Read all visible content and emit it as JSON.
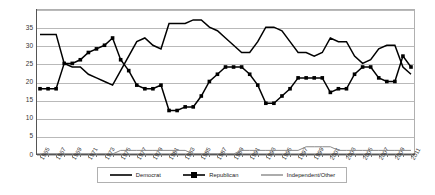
{
  "chart_data": {
    "type": "line",
    "title": "",
    "xlabel": "",
    "ylabel": "",
    "ylim": [
      0,
      40
    ],
    "ytick_values": [
      0,
      5,
      10,
      15,
      20,
      25,
      30,
      35
    ],
    "grid": true,
    "legend_position": "bottom",
    "x": [
      1965,
      1966,
      1967,
      1968,
      1969,
      1970,
      1971,
      1972,
      1973,
      1974,
      1975,
      1976,
      1977,
      1978,
      1979,
      1980,
      1981,
      1982,
      1983,
      1984,
      1985,
      1986,
      1987,
      1988,
      1989,
      1990,
      1991,
      1992,
      1993,
      1994,
      1995,
      1996,
      1997,
      1998,
      1999,
      2000,
      2001,
      2002,
      2003,
      2004,
      2005,
      2006,
      2007,
      2008,
      2009,
      2010,
      2011
    ],
    "xtick_labels": [
      "1965",
      "1967",
      "1969",
      "1971",
      "1973",
      "1975",
      "1977",
      "1979",
      "1981",
      "1983",
      "1985",
      "1987",
      "1989",
      "1991",
      "1993",
      "1995",
      "1997",
      "1999",
      "2001",
      "2003",
      "2005",
      "2007",
      "2009",
      "2011"
    ],
    "series": [
      {
        "name": "Democrat",
        "marker": "none",
        "color": "#000000",
        "values": [
          33,
          33,
          33,
          25,
          24,
          24,
          22,
          21,
          20,
          19,
          23,
          27,
          31,
          32,
          30,
          29,
          36,
          36,
          36,
          37,
          37,
          35,
          34,
          32,
          30,
          28,
          28,
          31,
          35,
          35,
          34,
          31,
          28,
          28,
          27,
          28,
          32,
          31,
          31,
          27,
          25,
          26,
          29,
          30,
          30,
          24,
          22
        ]
      },
      {
        "name": "Republican",
        "marker": "square",
        "color": "#000000",
        "values": [
          18,
          18,
          18,
          25,
          25,
          26,
          28,
          29,
          30,
          32,
          26,
          23,
          19,
          18,
          18,
          19,
          12,
          12,
          13,
          13,
          16,
          20,
          22,
          24,
          24,
          24,
          22,
          19,
          14,
          14,
          16,
          18,
          21,
          21,
          21,
          21,
          17,
          18,
          18,
          22,
          24,
          24,
          21,
          20,
          20,
          27,
          24
        ]
      },
      {
        "name": "Independent/Other",
        "marker": "none",
        "color": "#888888",
        "values": [
          0,
          0,
          0,
          0,
          0,
          0,
          0,
          0,
          0,
          0,
          1,
          1,
          1,
          1,
          1,
          1,
          1,
          1,
          1,
          0,
          0,
          0,
          0,
          0,
          0,
          1,
          1,
          1,
          1,
          1,
          1,
          1,
          1,
          2,
          2,
          2,
          2,
          1,
          1,
          1,
          1,
          1,
          1,
          1,
          1,
          1,
          1
        ]
      }
    ]
  },
  "legend": {
    "entries": [
      {
        "label": "Democrat",
        "style": "plain-line"
      },
      {
        "label": "Republican",
        "style": "line-with-square-markers"
      },
      {
        "label": "Independent/Other",
        "style": "light-line"
      }
    ]
  }
}
